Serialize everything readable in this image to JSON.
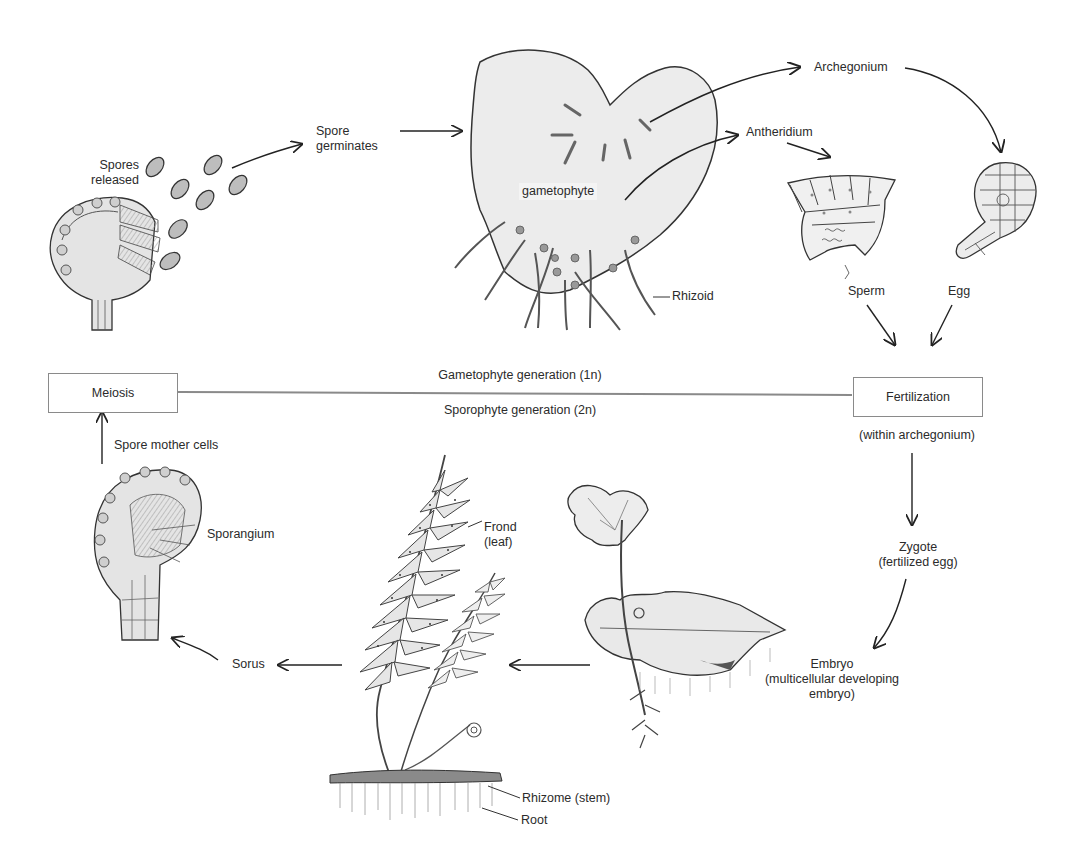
{
  "diagram": {
    "generation_line": {
      "top_label": "Gametophyte generation (1n)",
      "bottom_label": "Sporophyte generation (2n)"
    },
    "boxes": {
      "meiosis": "Meiosis",
      "fertilization": "Fertilization"
    },
    "labels": {
      "spores_released_1": "Spores",
      "spores_released_2": "released",
      "spore_germinates_1": "Spore",
      "spore_germinates_2": "germinates",
      "gametophyte": "gametophyte",
      "rhizoid": "Rhizoid",
      "archegonium": "Archegonium",
      "antheridium": "Antheridium",
      "sperm": "Sperm",
      "egg": "Egg",
      "within_archegonium": "(within archegonium)",
      "zygote_1": "Zygote",
      "zygote_2": "(fertilized egg)",
      "embryo_1": "Embryo",
      "embryo_2": "(multicellular developing",
      "embryo_3": "embryo)",
      "frond_1": "Frond",
      "frond_2": "(leaf)",
      "rhizome": "Rhizome (stem)",
      "root": "Root",
      "sorus": "Sorus",
      "sporangium": "Sporangium",
      "spore_mother_cells": "Spore mother cells"
    }
  }
}
